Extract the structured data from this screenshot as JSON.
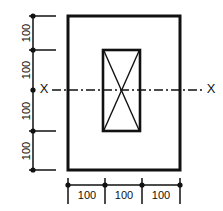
{
  "drawing": {
    "title": "Rectangular section with central opening",
    "units_note": "",
    "line_color": "#111111",
    "background_color": "#ffffff",
    "axis_label_left": "X",
    "axis_label_right": "X",
    "vertical_dimensions": [
      {
        "label": "100"
      },
      {
        "label": "100"
      },
      {
        "label": "100"
      },
      {
        "label": "100"
      }
    ],
    "horizontal_dimensions": [
      {
        "label": "100"
      },
      {
        "label": "100"
      },
      {
        "label": "100"
      }
    ],
    "geometry": {
      "outer_rect": {
        "x": 68,
        "y": 16,
        "width": 112,
        "height": 154
      },
      "inner_rect": {
        "x": 103,
        "y": 50,
        "width": 37,
        "height": 81
      },
      "vertical_dim_line_x": 33,
      "vertical_dim_ticks_y": [
        16,
        50,
        90,
        131,
        170
      ],
      "horizontal_dim_line_y": 185,
      "horizontal_dim_ticks_x": [
        68,
        105,
        142,
        180
      ],
      "centerline_y": 90,
      "centerline_x_start": 52,
      "centerline_x_end": 203
    }
  }
}
